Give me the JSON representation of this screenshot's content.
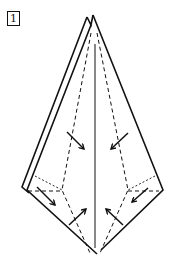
{
  "step": {
    "number": "1"
  },
  "diagram": {
    "colors": {
      "line": "#111111",
      "background": "#ffffff"
    },
    "elements": [
      "double-layer outer edges (left)",
      "single outer edge (right)",
      "center vertical crease",
      "dashed fold lines",
      "six fold-direction arrows"
    ]
  }
}
